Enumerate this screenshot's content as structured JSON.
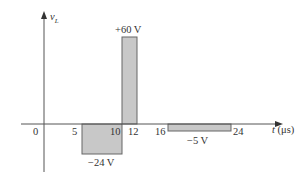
{
  "diagram": {
    "y_axis_label": "v",
    "y_axis_subscript": "L",
    "x_axis_label_var": "t",
    "x_axis_label_unit": " (μs)",
    "tick_labels": [
      "0",
      "5",
      "10",
      "12",
      "16",
      "24"
    ],
    "pulses": [
      {
        "start": 5,
        "end": 10,
        "value": -24,
        "label": "−24 V"
      },
      {
        "start": 10,
        "end": 12,
        "value": 60,
        "label": "+60 V"
      },
      {
        "start": 16,
        "end": 24,
        "value": -5,
        "label": "−5 V"
      }
    ],
    "colors": {
      "axis": "#555555",
      "fill": "#c8c8c8",
      "stroke": "#666666",
      "text": "#333333"
    }
  }
}
